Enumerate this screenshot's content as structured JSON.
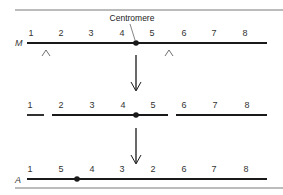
{
  "diagram": {
    "centromere_label": "Centromere",
    "colors": {
      "line": "#1a1a1a",
      "rule": "#555555",
      "text": "#333333"
    },
    "top_row": {
      "label": "M",
      "genes": [
        "1",
        "2",
        "3",
        "4",
        "5",
        "6",
        "7",
        "8"
      ],
      "break_marks": [
        "^",
        "^"
      ]
    },
    "middle_row": {
      "genes": [
        "1",
        "2",
        "3",
        "4",
        "5",
        "6",
        "7",
        "8"
      ]
    },
    "bottom_row": {
      "label": "A",
      "genes": [
        "1",
        "5",
        "4",
        "3",
        "2",
        "6",
        "7",
        "8"
      ]
    }
  }
}
